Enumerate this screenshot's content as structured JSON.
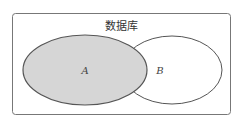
{
  "diagram": {
    "title": "数据库",
    "sets": [
      {
        "label": "A",
        "fill": "#d6d6d6"
      },
      {
        "label": "B",
        "fill": "#ffffff"
      }
    ],
    "stroke": "#555555"
  }
}
